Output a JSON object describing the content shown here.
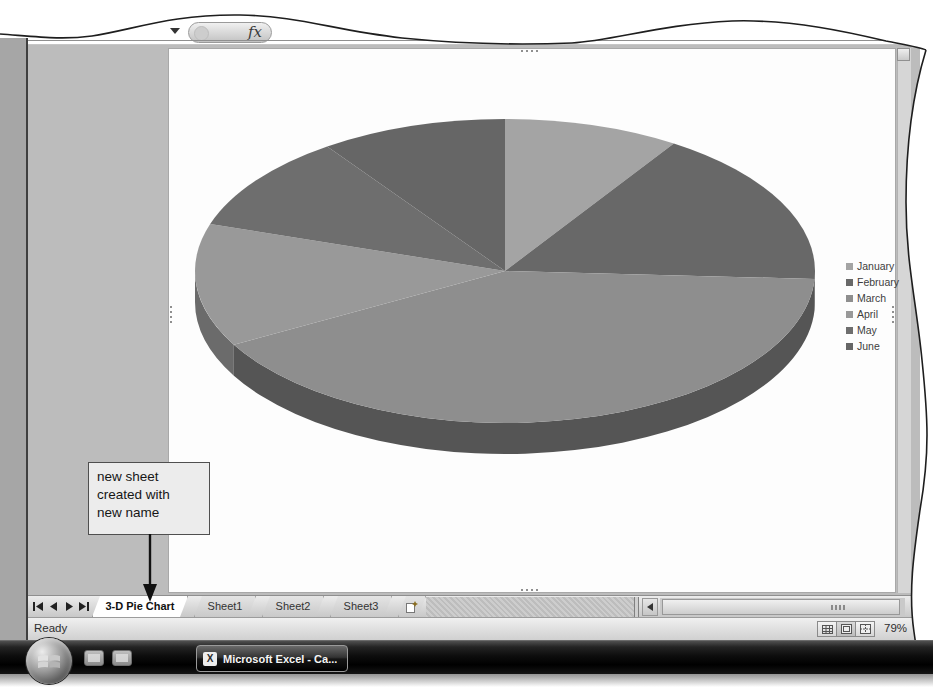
{
  "app": {
    "name": "Microsoft Excel",
    "view": "chart sheet"
  },
  "formula_bar": {
    "fx_label": "fx",
    "icons": [
      "name-box-dropdown-icon",
      "insert-function-icon"
    ]
  },
  "chart_data": {
    "type": "pie",
    "is_3d": true,
    "title": "",
    "categories": [
      "January",
      "February",
      "March",
      "April",
      "May",
      "June"
    ],
    "values_est_pct": [
      9.2,
      16.7,
      41.1,
      13.1,
      10.3,
      9.7
    ],
    "slices": [
      {
        "name": "January",
        "start_deg": 0,
        "end_deg": 33,
        "est_pct": 9.2,
        "print_gray": "#a4a4a4",
        "side_gray": "#7a7a7a"
      },
      {
        "name": "February",
        "start_deg": 33,
        "end_deg": 93,
        "est_pct": 16.7,
        "print_gray": "#686868",
        "side_gray": "#454545"
      },
      {
        "name": "March",
        "start_deg": 93,
        "end_deg": 241,
        "est_pct": 41.1,
        "print_gray": "#8e8e8e",
        "side_gray": "#555555"
      },
      {
        "name": "April",
        "start_deg": 241,
        "end_deg": 288,
        "est_pct": 13.1,
        "print_gray": "#999999",
        "side_gray": "#6b6b6b"
      },
      {
        "name": "May",
        "start_deg": 288,
        "end_deg": 325,
        "est_pct": 10.3,
        "print_gray": "#6e6e6e",
        "side_gray": "#4a4a4a"
      },
      {
        "name": "June",
        "start_deg": 325,
        "end_deg": 360,
        "est_pct": 9.7,
        "print_gray": "#666666",
        "side_gray": "#454545"
      }
    ],
    "legend_position": "right",
    "data_labels": false,
    "geometry": {
      "cx": 337,
      "cy": 223,
      "rx": 310,
      "ry": 152,
      "depth": 31
    }
  },
  "callout": {
    "text": "new sheet\ncreated with\nnew name"
  },
  "sheet_tabs": {
    "nav_icons": [
      "first-sheet-icon",
      "previous-sheet-icon",
      "next-sheet-icon",
      "last-sheet-icon"
    ],
    "tabs": [
      {
        "label": "3-D Pie Chart",
        "active": true,
        "width": 96
      },
      {
        "label": "Sheet1",
        "active": false,
        "width": 62
      },
      {
        "label": "Sheet2",
        "active": false,
        "width": 62
      },
      {
        "label": "Sheet3",
        "active": false,
        "width": 62
      }
    ],
    "insert_worksheet_icon": "insert-worksheet-icon"
  },
  "status_bar": {
    "ready_label": "Ready",
    "view_buttons": [
      "normal-view-icon",
      "page-layout-view-icon",
      "page-break-preview-icon"
    ],
    "zoom_label": "79%"
  },
  "taskbar": {
    "start_icon": "windows-start-orb",
    "quick_launch_icons": [
      "quick-launch-icon-1",
      "quick-launch-icon-2"
    ],
    "excel_button_label": "Microsoft Excel - Ca...",
    "excel_button_icon": "excel-app-icon"
  },
  "colors": {
    "workbook_bg": "#bcbcbc",
    "chart_sheet_bg": "#fdfdfd",
    "taskbar_bg": "#000000",
    "callout_bg": "#ececec",
    "callout_border": "#4f4f4f"
  }
}
